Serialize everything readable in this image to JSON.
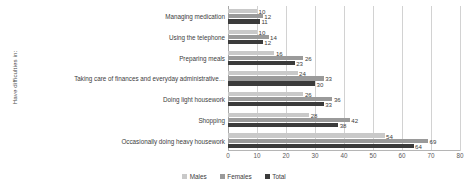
{
  "chart_data": {
    "type": "bar",
    "orientation": "horizontal",
    "title": "",
    "xlabel": "",
    "ylabel": "Have difficulties in:",
    "xlim": [
      0,
      80
    ],
    "xticks": [
      0,
      10,
      20,
      30,
      40,
      50,
      60,
      70,
      80
    ],
    "grid": true,
    "legend_position": "bottom-center",
    "categories": [
      "Managing medication",
      "Using the telephone",
      "Preparing meals",
      "Taking care of finances and everyday administrative…",
      "Doing light housework",
      "Shopping",
      "Occasionally doing heavy housework"
    ],
    "series": [
      {
        "name": "Males",
        "color": "#c9c9c9",
        "values": [
          10,
          10,
          16,
          24,
          26,
          28,
          54
        ]
      },
      {
        "name": "Females",
        "color": "#9a9a9a",
        "values": [
          12,
          14,
          26,
          33,
          36,
          42,
          69
        ]
      },
      {
        "name": "Total",
        "color": "#3b3b3b",
        "values": [
          11,
          12,
          23,
          30,
          33,
          38,
          64
        ]
      }
    ]
  },
  "legend": {
    "items": [
      {
        "label": "Males",
        "color": "#c9c9c9"
      },
      {
        "label": "Females",
        "color": "#9a9a9a"
      },
      {
        "label": "Total",
        "color": "#3b3b3b"
      }
    ]
  }
}
